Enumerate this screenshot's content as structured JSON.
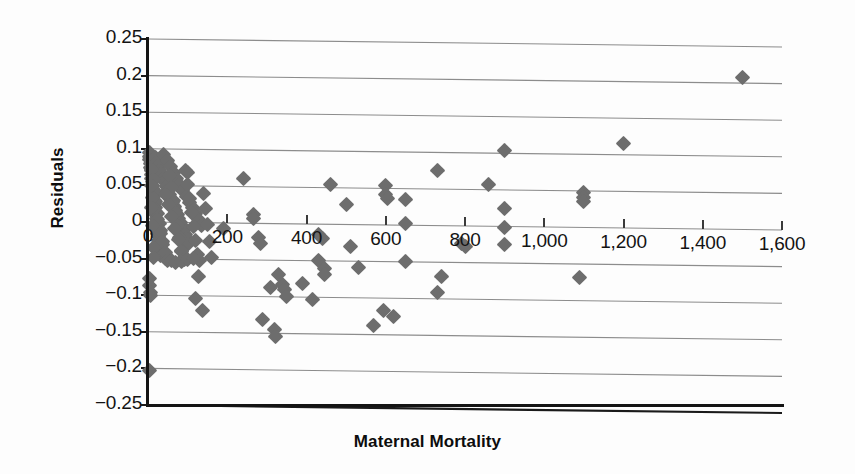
{
  "chart_data": {
    "type": "scatter",
    "title": "",
    "xlabel": "Maternal Mortality",
    "ylabel": "Residuals",
    "xlim": [
      0,
      1600
    ],
    "ylim": [
      -0.25,
      0.25
    ],
    "grid": "horizontal",
    "legend": "none",
    "marker": {
      "shape": "diamond",
      "color": "#6d6d6d",
      "size": 11
    },
    "x_ticks": [
      0,
      200,
      400,
      600,
      800,
      1000,
      1200,
      1400,
      1600
    ],
    "x_tick_labels": [
      "0",
      "200",
      "400",
      "600",
      "800",
      "1,000",
      "1,200",
      "1,400",
      "1,600"
    ],
    "y_ticks": [
      0.25,
      0.2,
      0.15,
      0.1,
      0.05,
      0,
      -0.05,
      -0.1,
      -0.15,
      -0.2,
      -0.25
    ],
    "y_tick_labels": [
      "0.25",
      "0.2",
      "0.15",
      "0.1",
      "0.05",
      "0",
      "−0.05",
      "−0.1",
      "−0.15",
      "−0.2",
      "−0.25"
    ],
    "points": [
      [
        1500,
        0.207
      ],
      [
        1200,
        0.116
      ],
      [
        900,
        0.104
      ],
      [
        730,
        0.075
      ],
      [
        860,
        0.057
      ],
      [
        1100,
        0.048
      ],
      [
        1100,
        0.041
      ],
      [
        1100,
        0.035
      ],
      [
        600,
        0.054
      ],
      [
        600,
        0.042
      ],
      [
        605,
        0.036
      ],
      [
        650,
        0.035
      ],
      [
        460,
        0.055
      ],
      [
        500,
        0.028
      ],
      [
        650,
        0.002
      ],
      [
        900,
        0.025
      ],
      [
        900,
        -0.001
      ],
      [
        900,
        -0.024
      ],
      [
        240,
        0.061
      ],
      [
        100,
        0.068
      ],
      [
        265,
        0.012
      ],
      [
        265,
        0.006
      ],
      [
        190,
        -0.008
      ],
      [
        280,
        -0.019
      ],
      [
        285,
        -0.027
      ],
      [
        430,
        -0.014
      ],
      [
        440,
        -0.019
      ],
      [
        430,
        -0.049
      ],
      [
        445,
        -0.06
      ],
      [
        445,
        -0.068
      ],
      [
        510,
        -0.03
      ],
      [
        530,
        -0.058
      ],
      [
        650,
        -0.05
      ],
      [
        790,
        -0.024
      ],
      [
        800,
        -0.028
      ],
      [
        740,
        -0.069
      ],
      [
        1090,
        -0.069
      ],
      [
        730,
        -0.092
      ],
      [
        310,
        -0.088
      ],
      [
        340,
        -0.083
      ],
      [
        345,
        -0.09
      ],
      [
        350,
        -0.1
      ],
      [
        390,
        -0.081
      ],
      [
        415,
        -0.103
      ],
      [
        330,
        -0.07
      ],
      [
        128,
        -0.074
      ],
      [
        120,
        -0.104
      ],
      [
        137,
        -0.12
      ],
      [
        290,
        -0.131
      ],
      [
        320,
        -0.145
      ],
      [
        322,
        -0.154
      ],
      [
        570,
        -0.137
      ],
      [
        595,
        -0.117
      ],
      [
        620,
        -0.125
      ],
      [
        5,
        -0.203
      ],
      [
        5,
        -0.077
      ],
      [
        5,
        -0.087
      ],
      [
        6,
        -0.096
      ],
      [
        7,
        -0.101
      ],
      [
        3,
        0.095
      ],
      [
        4,
        0.09
      ],
      [
        5,
        0.086
      ],
      [
        6,
        0.08
      ],
      [
        7,
        0.075
      ],
      [
        8,
        0.07
      ],
      [
        9,
        0.065
      ],
      [
        10,
        0.06
      ],
      [
        11,
        0.055
      ],
      [
        12,
        0.05
      ],
      [
        13,
        0.045
      ],
      [
        14,
        0.04
      ],
      [
        15,
        0.035
      ],
      [
        16,
        0.03
      ],
      [
        17,
        0.025
      ],
      [
        18,
        0.02
      ],
      [
        19,
        0.015
      ],
      [
        20,
        0.01
      ],
      [
        21,
        0.005
      ],
      [
        22,
        0.0
      ],
      [
        23,
        -0.005
      ],
      [
        24,
        -0.01
      ],
      [
        25,
        -0.015
      ],
      [
        26,
        -0.02
      ],
      [
        27,
        -0.025
      ],
      [
        28,
        -0.03
      ],
      [
        29,
        -0.035
      ],
      [
        30,
        -0.04
      ],
      [
        31,
        -0.045
      ],
      [
        18,
        0.088
      ],
      [
        22,
        0.082
      ],
      [
        26,
        0.077
      ],
      [
        30,
        0.071
      ],
      [
        34,
        0.066
      ],
      [
        38,
        0.06
      ],
      [
        42,
        0.055
      ],
      [
        46,
        0.049
      ],
      [
        50,
        0.044
      ],
      [
        54,
        0.038
      ],
      [
        58,
        0.033
      ],
      [
        62,
        0.027
      ],
      [
        66,
        0.022
      ],
      [
        70,
        0.016
      ],
      [
        74,
        0.011
      ],
      [
        78,
        0.005
      ],
      [
        82,
        0.0
      ],
      [
        86,
        -0.006
      ],
      [
        90,
        -0.011
      ],
      [
        94,
        -0.017
      ],
      [
        98,
        -0.022
      ],
      [
        102,
        -0.028
      ],
      [
        40,
        0.092
      ],
      [
        48,
        0.084
      ],
      [
        56,
        0.076
      ],
      [
        64,
        0.068
      ],
      [
        72,
        0.06
      ],
      [
        80,
        0.052
      ],
      [
        88,
        0.044
      ],
      [
        96,
        0.036
      ],
      [
        104,
        0.028
      ],
      [
        112,
        0.02
      ],
      [
        120,
        0.012
      ],
      [
        128,
        0.004
      ],
      [
        136,
        -0.004
      ],
      [
        10,
        0.072
      ],
      [
        14,
        0.058
      ],
      [
        16,
        0.042
      ],
      [
        20,
        0.028
      ],
      [
        24,
        0.012
      ],
      [
        28,
        -0.002
      ],
      [
        32,
        -0.016
      ],
      [
        36,
        -0.03
      ],
      [
        40,
        -0.044
      ],
      [
        44,
        -0.049
      ],
      [
        55,
        0.064
      ],
      [
        60,
        0.047
      ],
      [
        65,
        0.03
      ],
      [
        70,
        0.013
      ],
      [
        75,
        -0.004
      ],
      [
        80,
        -0.021
      ],
      [
        85,
        -0.038
      ],
      [
        90,
        -0.049
      ],
      [
        95,
        0.071
      ],
      [
        100,
        0.052
      ],
      [
        105,
        0.033
      ],
      [
        110,
        0.014
      ],
      [
        115,
        -0.005
      ],
      [
        120,
        -0.024
      ],
      [
        125,
        -0.043
      ],
      [
        130,
        -0.052
      ],
      [
        45,
        0.038
      ],
      [
        52,
        0.024
      ],
      [
        59,
        0.008
      ],
      [
        68,
        -0.008
      ],
      [
        76,
        -0.024
      ],
      [
        84,
        -0.04
      ],
      [
        92,
        -0.05
      ],
      [
        12,
        0.033
      ],
      [
        17,
        0.018
      ],
      [
        23,
        0.003
      ],
      [
        31,
        -0.012
      ],
      [
        37,
        -0.027
      ],
      [
        43,
        -0.042
      ],
      [
        49,
        -0.052
      ],
      [
        140,
        0.04
      ],
      [
        145,
        0.02
      ],
      [
        150,
        -0.002
      ],
      [
        155,
        -0.025
      ],
      [
        160,
        -0.047
      ],
      [
        60,
        -0.052
      ],
      [
        70,
        -0.055
      ],
      [
        85,
        -0.053
      ],
      [
        100,
        -0.051
      ],
      [
        115,
        -0.049
      ],
      [
        8,
        0.05
      ],
      [
        9,
        0.02
      ],
      [
        11,
        -0.005
      ],
      [
        13,
        -0.035
      ],
      [
        15,
        -0.048
      ]
    ]
  },
  "axes": {
    "y_title": "Residuals",
    "x_title": "Maternal Mortality"
  }
}
